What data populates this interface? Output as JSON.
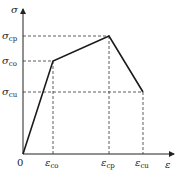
{
  "diagram": {
    "type": "stress-strain constitutive curve",
    "axes": {
      "y_label": "σ",
      "x_label": "ε",
      "origin_label": "0"
    },
    "y_ticks": [
      {
        "sym": "σ",
        "sub": "cp"
      },
      {
        "sym": "σ",
        "sub": "co"
      },
      {
        "sym": "σ",
        "sub": "cu"
      }
    ],
    "x_ticks": [
      {
        "sym": "ε",
        "sub": "co"
      },
      {
        "sym": "ε",
        "sub": "cp"
      },
      {
        "sym": "ε",
        "sub": "cu"
      }
    ],
    "curve_points": [
      {
        "name": "origin",
        "x": "0",
        "y": "0"
      },
      {
        "name": "elastic-limit",
        "x": "ε_co",
        "y": "σ_co"
      },
      {
        "name": "peak",
        "x": "ε_cp",
        "y": "σ_cp"
      },
      {
        "name": "ultimate",
        "x": "ε_cu",
        "y": "σ_cu"
      }
    ],
    "colors": {
      "line": "#1a1a1a",
      "dash": "#333333",
      "axis": "#222222"
    }
  }
}
